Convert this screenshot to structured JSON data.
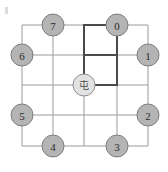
{
  "figure": {
    "title": "",
    "background_color": "#ffffff",
    "corner_mark": "",
    "grid": {
      "color": "#9a9a9a",
      "line_width": 1,
      "x_lines": [
        22,
        53,
        84,
        117,
        148
      ],
      "y_lines": [
        25,
        55,
        85,
        115,
        146
      ]
    },
    "highlight_path": {
      "color": "#4a4a4a",
      "line_width": 2,
      "segments": [
        {
          "name": "top-horizontal",
          "x1": 84,
          "y1": 25,
          "x2": 117,
          "y2": 25
        },
        {
          "name": "left-vertical",
          "x1": 84,
          "y1": 25,
          "x2": 84,
          "y2": 85
        },
        {
          "name": "middle-horizontal",
          "x1": 84,
          "y1": 55,
          "x2": 117,
          "y2": 55
        },
        {
          "name": "right-vertical",
          "x1": 117,
          "y1": 25,
          "x2": 117,
          "y2": 85
        },
        {
          "name": "bottom-horizontal",
          "x1": 84,
          "y1": 85,
          "x2": 117,
          "y2": 85
        }
      ]
    },
    "nodes": {
      "radius": 11,
      "fill": "#b4b4b4",
      "stroke": "#7d7d7d",
      "text_color": "#2b2b2b",
      "items": [
        {
          "id": "node-0",
          "label": "0",
          "cx": 117,
          "cy": 25
        },
        {
          "id": "node-1",
          "label": "1",
          "cx": 148,
          "cy": 55
        },
        {
          "id": "node-2",
          "label": "2",
          "cx": 148,
          "cy": 115
        },
        {
          "id": "node-3",
          "label": "3",
          "cx": 117,
          "cy": 146
        },
        {
          "id": "node-4",
          "label": "4",
          "cx": 53,
          "cy": 146
        },
        {
          "id": "node-5",
          "label": "5",
          "cx": 22,
          "cy": 115
        },
        {
          "id": "node-6",
          "label": "6",
          "cx": 22,
          "cy": 55
        },
        {
          "id": "node-7",
          "label": "7",
          "cx": 53,
          "cy": 25
        }
      ]
    },
    "center_node": {
      "id": "center-node",
      "label": "屯",
      "cx": 84,
      "cy": 85,
      "radius": 11,
      "fill": "#e2e2e2",
      "stroke": "#8f8f8f",
      "text_color": "#4a4a4a"
    }
  }
}
